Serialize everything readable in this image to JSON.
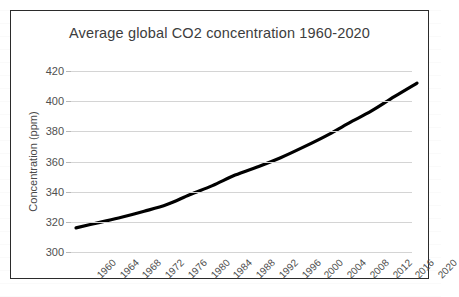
{
  "chart_data": {
    "type": "line",
    "title": "Average global CO2 concentration 1960-2020",
    "xlabel": "",
    "ylabel": "Concentration (ppm)",
    "ylim": [
      300,
      420
    ],
    "ytick_step": 20,
    "ytick_labels": [
      "420",
      "400",
      "380",
      "360",
      "340",
      "320",
      "300"
    ],
    "ytick_values": [
      420,
      400,
      380,
      360,
      340,
      320,
      300
    ],
    "xlim": [
      1960,
      2020
    ],
    "xtick_step": 4,
    "categories": [
      "1960",
      "1964",
      "1968",
      "1972",
      "1976",
      "1980",
      "1984",
      "1988",
      "1992",
      "1996",
      "2000",
      "2004",
      "2008",
      "2012",
      "2016",
      "2020"
    ],
    "x": [
      1960,
      1964,
      1968,
      1972,
      1976,
      1980,
      1984,
      1988,
      1992,
      1996,
      2000,
      2004,
      2008,
      2012,
      2016,
      2020
    ],
    "values": [
      316,
      319.5,
      323,
      327,
      331.5,
      338,
      344,
      351,
      356.5,
      362.5,
      369.5,
      377,
      385.5,
      393.5,
      403,
      412
    ],
    "series": [
      {
        "name": "Average global CO2 concentration",
        "values": [
          316,
          319.5,
          323,
          327,
          331.5,
          338,
          344,
          351,
          356.5,
          362.5,
          369.5,
          377,
          385.5,
          393.5,
          403,
          412
        ],
        "color": "#000000",
        "line_width": 3.2,
        "smoothed": true,
        "markers": false
      }
    ],
    "grid": {
      "horizontal": true,
      "vertical": false,
      "color": "#d4d4d4"
    },
    "legend": {
      "visible": false,
      "position": "none"
    },
    "colors": {
      "line": "#000000",
      "gridline": "#d4d4d4",
      "text": "#4d4d4d",
      "title": "#3d3d3d",
      "border": "#2b2b2b",
      "background": "#ffffff"
    }
  }
}
